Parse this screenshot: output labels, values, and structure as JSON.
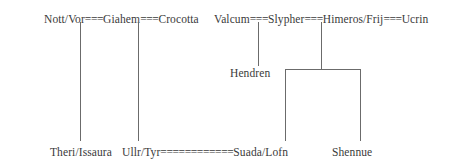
{
  "diagram": {
    "kind": "family-tree",
    "width": 462,
    "height": 164,
    "background_color": "#ffffff",
    "text_color": "#3a3a3a",
    "line_color": "#6b6b6b",
    "union_symbol": "="
  },
  "rows": {
    "top": {
      "left_group": {
        "full_text": "Nott/Vor===Giahem===Crocotta",
        "members": [
          "Nott/Vor",
          "Giahem",
          "Crocotta"
        ],
        "unions": [
          "===",
          "==="
        ]
      },
      "right_group": {
        "full_text": "Valcum===Slypher===Himeros/Frij===Ucrin",
        "members": [
          "Valcum",
          "Slypher",
          "Himeros/Frij",
          "Ucrin"
        ],
        "unions": [
          "===",
          "===",
          "==="
        ]
      }
    },
    "middle": {
      "nodes": [
        {
          "label": "Hendren"
        }
      ]
    },
    "bottom": {
      "full_text": "Theri/Issaura  Ullr/Tyr============Suada/Lofn  Shennue",
      "nodes": [
        {
          "label": "Theri/Issaura"
        },
        {
          "label": "Ullr/Tyr"
        },
        {
          "union": "============"
        },
        {
          "label": "Suada/Lofn"
        },
        {
          "label": "Shennue"
        }
      ]
    }
  },
  "labels": {
    "nott_vor": "Nott/Vor",
    "giahem": "Giahem",
    "crocotta": "Crocotta",
    "valcum": "Valcum",
    "slypher": "Slypher",
    "himeros_frij": "Himeros/Frij",
    "ucrin": "Ucrin",
    "hendren": "Hendren",
    "theri_issaura": "Theri/Issaura",
    "ullr_tyr": "Ullr/Tyr",
    "suada_lofn": "Suada/Lofn",
    "shennue": "Shennue",
    "eq3_a": "===",
    "eq3_b": "===",
    "eq3_c": "===",
    "eq3_d": "===",
    "eq3_e": "===",
    "eq_long": "============"
  }
}
